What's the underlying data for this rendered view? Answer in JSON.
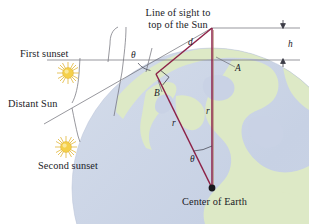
{
  "figure": {
    "title": "Line of sight to\ntop of the Sun",
    "domain": "physics-diagram"
  },
  "labels": {
    "line_of_sight_l1": "Line of sight to",
    "line_of_sight_l2": "top of the Sun",
    "first_sunset": "First sunset",
    "distant_sun": "Distant Sun",
    "second_sunset": "Second sunset",
    "center_of_earth": "Center of Earth",
    "d": "d",
    "h": "h",
    "A": "A",
    "B": "B",
    "r_right": "r",
    "r_diag": "r",
    "theta_top": "θ",
    "theta_center": "θ"
  },
  "colors": {
    "ocean": "#ccd5e6",
    "land": "#dde9c6",
    "triangle_line": "#8d2247",
    "thin_line": "#6b6b74",
    "sun_core": "#f5d04a",
    "sun_ray": "#e8c04a",
    "text": "#1a1a26",
    "background": "#ffffff"
  },
  "geometry": {
    "earth_center": [
      212,
      188
    ],
    "point_A": [
      212,
      48
    ],
    "apex_top": [
      212,
      28
    ],
    "point_B": [
      156,
      74
    ],
    "radius_px": 140
  }
}
